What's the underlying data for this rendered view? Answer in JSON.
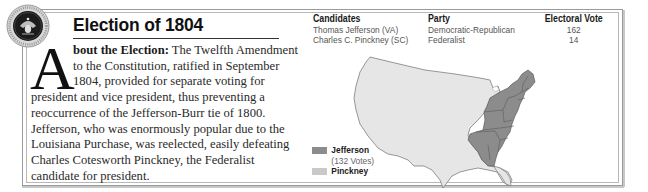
{
  "header": {
    "title": "Election of 1804",
    "seal_icon": "presidential-seal-icon"
  },
  "article": {
    "drop_cap": "A",
    "lead": "bout the Election:",
    "lines": [
      " The Twelfth Amendment",
      "to the Constitution, ratified in September",
      "1804, provided for separate voting for",
      "president and vice president, thus preventing a",
      "reoccurrence of the Jefferson-Burr tie of 1800.",
      "Jefferson, who was enormously popular due to the",
      "Louisiana Purchase, was reelected, easily defeating",
      "Charles Cotesworth Pinckney, the Federalist",
      "candidate for president."
    ]
  },
  "results_table": {
    "headers": [
      "Candidates",
      "Party",
      "Electoral Vote"
    ],
    "rows": [
      {
        "candidate": "Thomas Jefferson (VA)",
        "party": "Democratic-Republican",
        "electoral_vote": "162"
      },
      {
        "candidate": "Charles C. Pinckney (SC)",
        "party": "Federalist",
        "electoral_vote": "14"
      }
    ]
  },
  "map": {
    "legend": [
      {
        "label": "Jefferson",
        "sub": "(132 Votes)",
        "color": "#8c8c8c"
      },
      {
        "label": "Pinckney",
        "sub": "",
        "color": "#c9c9c9"
      }
    ],
    "colors": {
      "jefferson": "#8c8c8c",
      "pinckney": "#c9c9c9",
      "unassigned": "#e6e6e6",
      "outline": "#6e6e6e"
    }
  }
}
